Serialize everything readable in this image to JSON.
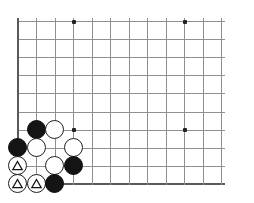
{
  "diagram": {
    "title": "Go board corner diagram",
    "type": "go-board",
    "board_size": 19,
    "visible_region": "bottom-left corner",
    "background_color": "#ffffff",
    "line_color": "#8f8f8f",
    "edge_line_color": "#5a5a5a",
    "black_stone_color": "#141414",
    "white_stone_color": "#ffffff",
    "stone_outline_color": "#1e1e1e",
    "mark_symbol": "triangle"
  },
  "grid": {
    "origin_x": 17.5,
    "origin_y": 21,
    "spacing_x": 18.5,
    "spacing_y": 18.1,
    "columns_visible": 12,
    "rows_visible": 10,
    "left_edge_index": 0,
    "bottom_edge_index": 9
  },
  "star_points": [
    {
      "name": "star-point-top-left",
      "col": 3,
      "row": 0
    },
    {
      "name": "star-point-top-right",
      "col": 9,
      "row": 0
    },
    {
      "name": "star-point-lower-left",
      "col": 3,
      "row": 6
    },
    {
      "name": "star-point-lower-right",
      "col": 9,
      "row": 6
    }
  ],
  "stones": [
    {
      "name": "black-stone-b1",
      "color": "black",
      "col": 1,
      "row": 6,
      "mark": ""
    },
    {
      "name": "white-stone-w1",
      "color": "white",
      "col": 2,
      "row": 6,
      "mark": ""
    },
    {
      "name": "black-stone-b2",
      "color": "black",
      "col": 0,
      "row": 7,
      "mark": ""
    },
    {
      "name": "white-stone-w2",
      "color": "white",
      "col": 1,
      "row": 7,
      "mark": ""
    },
    {
      "name": "white-stone-w3",
      "color": "white",
      "col": 3,
      "row": 7,
      "mark": ""
    },
    {
      "name": "white-stone-w4-marked",
      "color": "white",
      "col": 0,
      "row": 8,
      "mark": "triangle"
    },
    {
      "name": "white-stone-w5",
      "color": "white",
      "col": 2,
      "row": 8,
      "mark": ""
    },
    {
      "name": "black-stone-b3",
      "color": "black",
      "col": 3,
      "row": 8,
      "mark": ""
    },
    {
      "name": "white-stone-w6-marked",
      "color": "white",
      "col": 0,
      "row": 9,
      "mark": "triangle"
    },
    {
      "name": "white-stone-w7-marked",
      "color": "white",
      "col": 1,
      "row": 9,
      "mark": "triangle"
    },
    {
      "name": "black-stone-b4",
      "color": "black",
      "col": 2,
      "row": 9,
      "mark": ""
    }
  ],
  "caption": {
    "text": ""
  }
}
